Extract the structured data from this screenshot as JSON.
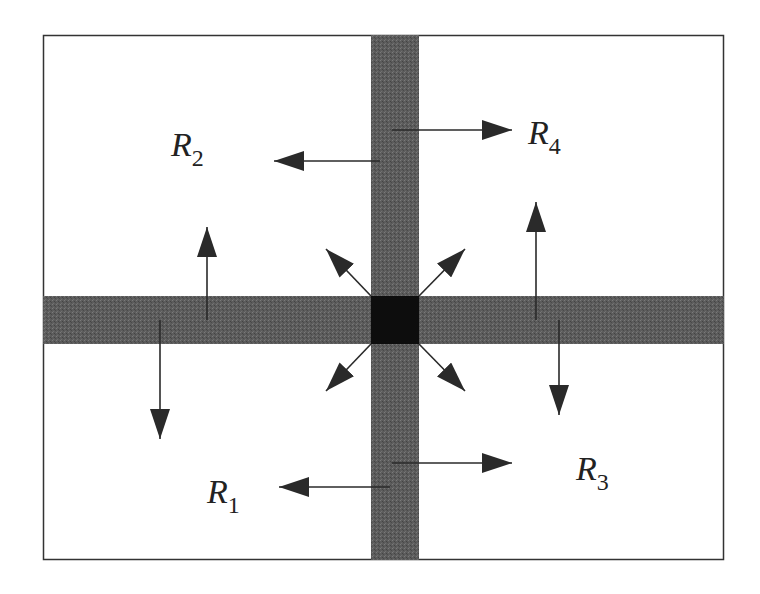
{
  "diagram": {
    "type": "region-partition",
    "colors": {
      "background": "#ffffff",
      "border": "#333333",
      "strip": "#5a5a5a",
      "center": "#0d0d0d",
      "arrow": "#2a2a2a"
    },
    "regions": [
      {
        "id": "R1",
        "base": "R",
        "sub": "1",
        "position": "bottom-left"
      },
      {
        "id": "R2",
        "base": "R",
        "sub": "2",
        "position": "top-left"
      },
      {
        "id": "R3",
        "base": "R",
        "sub": "3",
        "position": "bottom-right"
      },
      {
        "id": "R4",
        "base": "R",
        "sub": "4",
        "position": "top-right"
      }
    ],
    "arrows": [
      {
        "from": "vertical-strip",
        "to": "R2",
        "direction": "left"
      },
      {
        "from": "vertical-strip",
        "to": "R4",
        "direction": "right"
      },
      {
        "from": "vertical-strip",
        "to": "R1",
        "direction": "left"
      },
      {
        "from": "vertical-strip",
        "to": "R3",
        "direction": "right"
      },
      {
        "from": "horizontal-strip",
        "to": "R2",
        "direction": "up"
      },
      {
        "from": "horizontal-strip",
        "to": "R1",
        "direction": "down"
      },
      {
        "from": "horizontal-strip",
        "to": "R4",
        "direction": "up"
      },
      {
        "from": "horizontal-strip",
        "to": "R3",
        "direction": "down"
      },
      {
        "from": "center",
        "to": "R2",
        "direction": "up-left"
      },
      {
        "from": "center",
        "to": "R4",
        "direction": "up-right"
      },
      {
        "from": "center",
        "to": "R1",
        "direction": "down-left"
      },
      {
        "from": "center",
        "to": "R3",
        "direction": "down-right"
      }
    ]
  }
}
